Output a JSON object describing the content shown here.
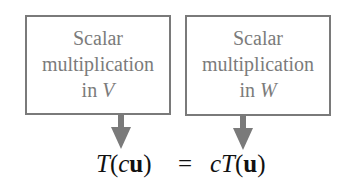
{
  "diagram": {
    "left_box": {
      "line1": "Scalar",
      "line2": "multiplication",
      "line3_prefix": "in ",
      "line3_var": "V"
    },
    "right_box": {
      "line1": "Scalar",
      "line2": "multiplication",
      "line3_prefix": "in ",
      "line3_var": "W"
    },
    "equation": {
      "lhs": {
        "func": "T",
        "open": "(",
        "scalar": "c",
        "vector": "u",
        "close": ")"
      },
      "equals": "=",
      "rhs": {
        "scalar": "c",
        "func": "T",
        "open": "(",
        "vector": "u",
        "close": ")"
      }
    },
    "colors": {
      "box_border": "#7a7a7a",
      "box_text": "#7b7b7b",
      "arrow": "#7a7a7a",
      "equation": "#111111"
    }
  }
}
